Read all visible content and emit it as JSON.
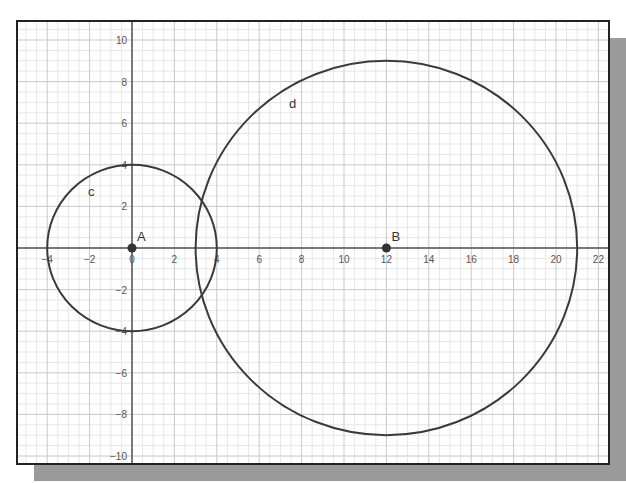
{
  "chart_data": {
    "type": "scatter",
    "title": "",
    "xlabel": "",
    "ylabel": "",
    "xlim": [
      -5.4,
      22.5
    ],
    "ylim": [
      -10.4,
      10.9
    ],
    "grid": true,
    "x_ticks": [
      -4,
      -2,
      0,
      2,
      4,
      6,
      8,
      10,
      12,
      14,
      16,
      18,
      20,
      22
    ],
    "y_ticks": [
      -10,
      -8,
      -6,
      -4,
      -2,
      2,
      4,
      6,
      8,
      10
    ],
    "points": [
      {
        "name": "A",
        "x": 0,
        "y": 0
      },
      {
        "name": "B",
        "x": 12,
        "y": 0
      }
    ],
    "circles": [
      {
        "name": "c",
        "center": "A",
        "cx": 0,
        "cy": 0,
        "r": 4
      },
      {
        "name": "d",
        "center": "B",
        "cx": 12,
        "cy": 0,
        "r": 9
      }
    ],
    "colors": {
      "curve": "#3a3a3a",
      "axis": "#555555",
      "grid_major": "#c8c8c8",
      "grid_minor": "#e6e6e6",
      "shadow": "#9a9a9a"
    }
  }
}
